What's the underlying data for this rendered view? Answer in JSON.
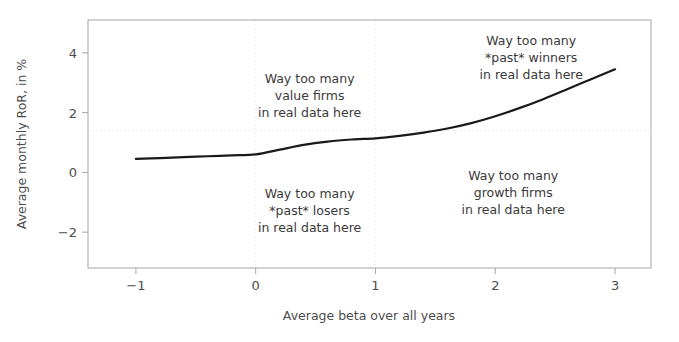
{
  "chart_data": {
    "type": "line",
    "title": "",
    "xlabel": "Average beta over all years",
    "ylabel": "Average monthly RoR, in %",
    "xlim": [
      -1.4,
      3.3
    ],
    "ylim": [
      -3.2,
      5.1
    ],
    "xticks": [
      -1,
      0,
      1,
      2,
      3
    ],
    "xticklabels": [
      "−1",
      "0",
      "1",
      "2",
      "3"
    ],
    "yticks": [
      -2,
      0,
      2,
      4
    ],
    "yticklabels": [
      "−2",
      "0",
      "2",
      "4"
    ],
    "grid": "faint dotted reference lines at x=0, x=1 and y=1.4",
    "legend": "none",
    "series": [
      {
        "name": "Average monthly RoR vs average beta",
        "x": [
          -1.0,
          -0.8,
          -0.6,
          -0.4,
          -0.2,
          0.0,
          0.2,
          0.4,
          0.6,
          0.8,
          1.0,
          1.2,
          1.4,
          1.6,
          1.8,
          2.0,
          2.2,
          2.4,
          2.6,
          2.8,
          3.0
        ],
        "values": [
          0.45,
          0.48,
          0.51,
          0.54,
          0.57,
          0.6,
          0.76,
          0.92,
          1.03,
          1.1,
          1.14,
          1.22,
          1.33,
          1.47,
          1.65,
          1.88,
          2.15,
          2.45,
          2.78,
          3.12,
          3.45
        ]
      }
    ],
    "reference_lines": {
      "vertical": [
        0,
        1
      ],
      "horizontal": [
        1.4
      ]
    },
    "annotations": [
      {
        "name": "value-firms-annotation",
        "lines": [
          "Way too many",
          "value firms",
          "in real data here"
        ],
        "x": 0.45,
        "y": 3.0
      },
      {
        "name": "past-winners-annotation",
        "lines": [
          "Way too many",
          "*past* winners",
          "in real data here"
        ],
        "x": 2.3,
        "y": 4.25
      },
      {
        "name": "past-losers-annotation",
        "lines": [
          "Way too many",
          "*past* losers",
          "in real data here"
        ],
        "x": 0.45,
        "y": -0.85
      },
      {
        "name": "growth-firms-annotation",
        "lines": [
          "Way too many",
          "growth firms",
          "in real data here"
        ],
        "x": 2.15,
        "y": -0.25
      }
    ],
    "colors": {
      "line": "#1a1a1a",
      "axis": "#9a9a9a",
      "text": "#3a3a3a",
      "tick_text": "#4d4d4d",
      "grid": "#e8e8e8",
      "background": "#ffffff"
    }
  }
}
